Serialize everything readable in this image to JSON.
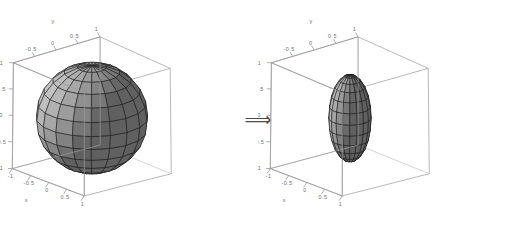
{
  "figure": {
    "background_color": "#ffffff",
    "transition_symbol": "⟹",
    "transition_name": "implies-arrow"
  },
  "chart_data": {
    "type": "scatter",
    "title": "",
    "subtitle": "",
    "panels": [
      {
        "name": "unit-sphere-plot",
        "label": "",
        "surface": {
          "shape": "sphere",
          "semi_axes": {
            "x": 1.0,
            "y": 1.0,
            "z": 1.0
          },
          "center": [
            0,
            0,
            0
          ],
          "mesh_meridians": 18,
          "mesh_parallels": 12,
          "face_color": "#9d9d9d",
          "edge_color": "#141414"
        },
        "axes": {
          "xlabel": "x",
          "ylabel": "y",
          "zlabel": "z",
          "xlim": [
            -1,
            1
          ],
          "ylim": [
            -1,
            1
          ],
          "zlim": [
            -1,
            1
          ],
          "xticks": [
            "-1",
            "-0.5",
            "0",
            "0.5",
            "1"
          ],
          "yticks": [
            "-0.5",
            "0",
            "0.5",
            "1"
          ],
          "zticks": [
            "-1",
            "-0.5",
            "0",
            "0.5",
            "1"
          ],
          "grid": false,
          "box": true
        }
      },
      {
        "name": "prolate-ellipsoid-plot",
        "label": "",
        "surface": {
          "shape": "ellipsoid",
          "semi_axes": {
            "x": 0.38,
            "y": 0.38,
            "z": 0.82
          },
          "center": [
            0,
            0,
            0
          ],
          "mesh_meridians": 18,
          "mesh_parallels": 12,
          "face_color": "#9d9d9d",
          "edge_color": "#141414"
        },
        "axes": {
          "xlabel": "x",
          "ylabel": "y",
          "zlabel": "z",
          "xlim": [
            -1,
            1
          ],
          "ylim": [
            -1,
            1
          ],
          "zlim": [
            -1,
            1
          ],
          "xticks": [
            "-1",
            "-0.5",
            "0",
            "0.5",
            "1"
          ],
          "yticks": [
            "-0.5",
            "0",
            "0.5",
            "1"
          ],
          "zticks": [
            "-1",
            "-0.5",
            "0",
            "0.5",
            "1"
          ],
          "grid": false,
          "box": true
        }
      }
    ],
    "legend": [],
    "annotations": [
      {
        "name": "implies-arrow",
        "text": "⟹",
        "between_panels": [
          0,
          1
        ]
      }
    ]
  }
}
